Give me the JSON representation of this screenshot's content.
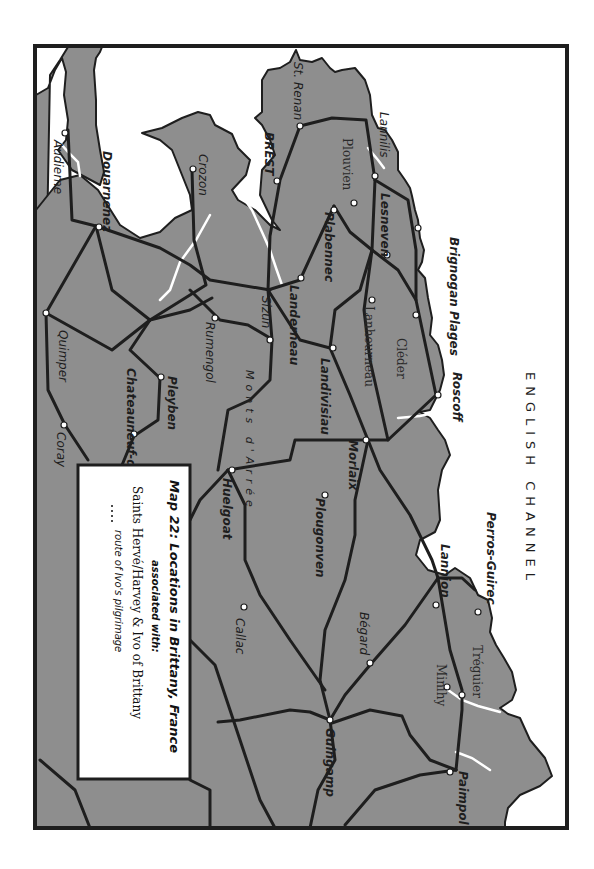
{
  "map": {
    "title": "Map 22: Locations in Brittany, France",
    "subtitle": "associated with:",
    "saints": "Saints Hervé/Harvey & Ivo of Brittany",
    "legend_route_symbol": "....",
    "legend_route_label": "route of Ivo's pilgrimage",
    "sea_label": "ENGLISH CHANNEL",
    "mountains_label": "Monts d'Arrée",
    "orientation": "rotated 90° clockwise (north faces right)",
    "colors": {
      "land": "#8e8e8e",
      "sea": "#ffffff",
      "roads": "#1e1e1e",
      "frame": "#1e1e1e"
    },
    "towns": [
      {
        "name": "St. Renan",
        "style": "italic"
      },
      {
        "name": "BREST",
        "style": "bold"
      },
      {
        "name": "Lannilis",
        "style": "italic"
      },
      {
        "name": "Plouvien",
        "style": "gothic"
      },
      {
        "name": "Plabennec",
        "style": "italic"
      },
      {
        "name": "Lesneven",
        "style": "italic"
      },
      {
        "name": "Brignogan Plages",
        "style": "bold"
      },
      {
        "name": "Lanhourneau",
        "style": "gothic"
      },
      {
        "name": "Cléder",
        "style": "gothic"
      },
      {
        "name": "Roscoff",
        "style": "bold"
      },
      {
        "name": "Audierne",
        "style": "italic"
      },
      {
        "name": "Douarnenez",
        "style": "bold"
      },
      {
        "name": "Crozon",
        "style": "italic"
      },
      {
        "name": "Landerneau",
        "style": "bold"
      },
      {
        "name": "Sizun",
        "style": "italic"
      },
      {
        "name": "Landivisiau",
        "style": "bold"
      },
      {
        "name": "Rumengol",
        "style": "italic"
      },
      {
        "name": "Quimper",
        "style": "italic"
      },
      {
        "name": "Pleyben",
        "style": "bold"
      },
      {
        "name": "Chateauneuf-de-Faou",
        "style": "bold"
      },
      {
        "name": "Coray",
        "style": "italic"
      },
      {
        "name": "Morlaix",
        "style": "bold"
      },
      {
        "name": "Huelgoat",
        "style": "bold"
      },
      {
        "name": "Plougonven",
        "style": "bold"
      },
      {
        "name": "Callac",
        "style": "italic"
      },
      {
        "name": "Perros-Guirec",
        "style": "bold"
      },
      {
        "name": "Lannion",
        "style": "bold"
      },
      {
        "name": "Bégard",
        "style": "italic"
      },
      {
        "name": "Tréguier",
        "style": "gothic"
      },
      {
        "name": "Minihy",
        "style": "gothic"
      },
      {
        "name": "Guingamp",
        "style": "bold"
      },
      {
        "name": "Paimpol",
        "style": "bold"
      }
    ]
  }
}
